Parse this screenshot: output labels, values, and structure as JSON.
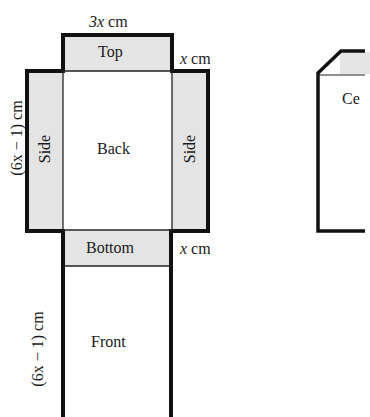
{
  "figure": {
    "net": {
      "panels": {
        "top": "Top",
        "back": "Back",
        "side_left": "Side",
        "side_right": "Side",
        "bottom": "Bottom",
        "front": "Front"
      },
      "dimensions": {
        "width_var": "3x",
        "width_unit": " cm",
        "depth_top_var": "x",
        "depth_top_unit": " cm",
        "depth_bottom_var": "x",
        "depth_bottom_unit": " cm",
        "height_back": "(6x − 1) cm",
        "height_front": "(6x − 1) cm"
      }
    },
    "cereal_box": {
      "label_partial": "Ce"
    },
    "colors": {
      "panel_fill": "#e4e4e4",
      "outline": "#111111",
      "background": "#ffffff"
    }
  }
}
